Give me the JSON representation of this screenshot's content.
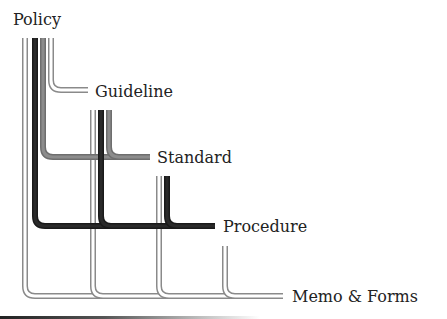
{
  "diagram": {
    "labels": [
      {
        "id": "policy",
        "text": "Policy",
        "x": 13,
        "y": 12
      },
      {
        "id": "guideline",
        "text": "Guideline",
        "x": 95,
        "y": 84
      },
      {
        "id": "standard",
        "text": "Standard",
        "x": 157,
        "y": 150
      },
      {
        "id": "procedure",
        "text": "Procedure",
        "x": 223,
        "y": 219
      },
      {
        "id": "memo-forms",
        "text": "Memo & Forms",
        "x": 292,
        "y": 289
      }
    ],
    "pipe_styles": {
      "light": {
        "fill": "#ffffff",
        "stroke": "#8a8a8a",
        "width": 5
      },
      "gray": {
        "fill": "#8c8c8c",
        "stroke": "#6e6e6e",
        "width": 5
      },
      "dark": {
        "fill": "#2a2a2a",
        "stroke": "#1a1a1a",
        "width": 5
      }
    },
    "pipes": [
      {
        "from": "policy",
        "to": "memo-forms",
        "style": "light",
        "x": 25,
        "y0": 38,
        "bend_y": 296,
        "x_end": 283
      },
      {
        "from": "policy",
        "to": "procedure",
        "style": "dark",
        "x": 35,
        "y0": 38,
        "bend_y": 226,
        "x_end": 215
      },
      {
        "from": "policy",
        "to": "standard",
        "style": "gray",
        "x": 43,
        "y0": 38,
        "bend_y": 157,
        "x_end": 150
      },
      {
        "from": "policy",
        "to": "guideline",
        "style": "light",
        "x": 51,
        "y0": 38,
        "bend_y": 90,
        "x_end": 88
      },
      {
        "from": "guideline",
        "to": "memo-forms",
        "style": "light",
        "x": 93,
        "y0": 110,
        "bend_y": 296,
        "x_end": 283
      },
      {
        "from": "guideline",
        "to": "procedure",
        "style": "dark",
        "x": 101,
        "y0": 110,
        "bend_y": 226,
        "x_end": 215
      },
      {
        "from": "guideline",
        "to": "standard",
        "style": "gray",
        "x": 109,
        "y0": 110,
        "bend_y": 157,
        "x_end": 150
      },
      {
        "from": "standard",
        "to": "memo-forms",
        "style": "light",
        "x": 159,
        "y0": 176,
        "bend_y": 296,
        "x_end": 283
      },
      {
        "from": "standard",
        "to": "procedure",
        "style": "dark",
        "x": 167,
        "y0": 176,
        "bend_y": 226,
        "x_end": 215
      },
      {
        "from": "procedure",
        "to": "memo-forms",
        "style": "light",
        "x": 225,
        "y0": 246,
        "bend_y": 296,
        "x_end": 283
      }
    ]
  }
}
